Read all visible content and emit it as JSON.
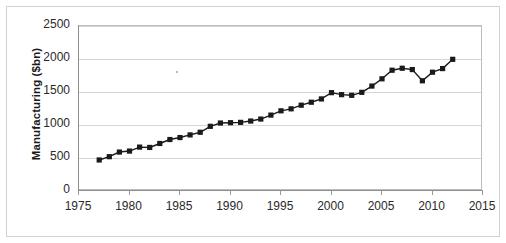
{
  "chart_data": {
    "type": "line",
    "title": "",
    "xlabel": "",
    "ylabel": "Manufacturing ($bn)",
    "xlim": [
      1975,
      2015
    ],
    "ylim": [
      0,
      2500
    ],
    "ytick_labels": [
      "0",
      "500",
      "1000",
      "1500",
      "2000",
      "2500"
    ],
    "ytick_values": [
      0,
      500,
      1000,
      1500,
      2000,
      2500
    ],
    "xtick_labels": [
      "1975",
      "1980",
      "1985",
      "1990",
      "1995",
      "2000",
      "2005",
      "2010",
      "2015"
    ],
    "xtick_values": [
      1975,
      1980,
      1985,
      1990,
      1995,
      2000,
      2005,
      2010,
      2015
    ],
    "grid": "horizontal",
    "legend": "none",
    "marker": "square",
    "series_color": "#1a1a1a",
    "grid_color": "#d6d6d6",
    "series": [
      {
        "name": "Manufacturing",
        "x": [
          1977,
          1978,
          1979,
          1980,
          1981,
          1982,
          1983,
          1984,
          1985,
          1986,
          1987,
          1988,
          1989,
          1990,
          1991,
          1992,
          1993,
          1994,
          1995,
          1996,
          1997,
          1998,
          1999,
          2000,
          2001,
          2002,
          2003,
          2004,
          2005,
          2006,
          2007,
          2008,
          2009,
          2010,
          2011,
          2012
        ],
        "values": [
          470,
          520,
          590,
          605,
          665,
          660,
          720,
          780,
          810,
          850,
          890,
          980,
          1030,
          1035,
          1040,
          1060,
          1090,
          1150,
          1215,
          1245,
          1300,
          1345,
          1395,
          1490,
          1460,
          1450,
          1495,
          1590,
          1700,
          1830,
          1860,
          1840,
          1670,
          1800,
          1855,
          1995
        ]
      }
    ]
  }
}
